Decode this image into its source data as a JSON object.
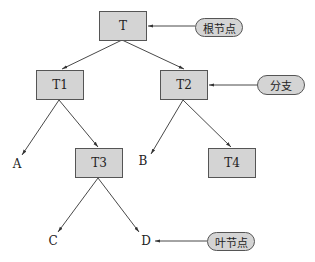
{
  "diagram": {
    "type": "tree",
    "nodes": {
      "root": {
        "label": "T"
      },
      "t1": {
        "label": "T1"
      },
      "t2": {
        "label": "T2"
      },
      "t3": {
        "label": "T3"
      },
      "t4": {
        "label": "T4"
      }
    },
    "leaves": {
      "a": {
        "label": "A"
      },
      "b": {
        "label": "B"
      },
      "c": {
        "label": "C"
      },
      "d": {
        "label": "D"
      }
    },
    "annotations": {
      "root_node": {
        "label": "根节点"
      },
      "branch": {
        "label": "分支"
      },
      "leaf_node": {
        "label": "叶节点"
      }
    },
    "edges": [
      [
        "T",
        "T1"
      ],
      [
        "T",
        "T2"
      ],
      [
        "T1",
        "A"
      ],
      [
        "T1",
        "T3"
      ],
      [
        "T2",
        "B"
      ],
      [
        "T2",
        "T4"
      ],
      [
        "T3",
        "C"
      ],
      [
        "T3",
        "D"
      ]
    ],
    "colors": {
      "node_fill": "#d4d4d4",
      "stroke": "#333333"
    }
  }
}
